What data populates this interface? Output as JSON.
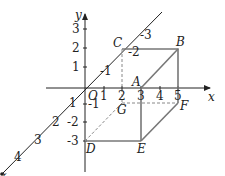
{
  "diagram": {
    "type": "3d-coordinate-box",
    "axes": {
      "x": {
        "label": "x",
        "ticks": [
          "1",
          "2",
          "3",
          "4",
          "5"
        ]
      },
      "y": {
        "label": "y",
        "ticks": [
          "3",
          "2",
          "1",
          "-1",
          "-2",
          "-3"
        ]
      },
      "z": {
        "label": "z",
        "ticks_neg": [
          "-1",
          "-2",
          "-3"
        ],
        "ticks_pos": [
          "1",
          "2",
          "3",
          "4"
        ]
      }
    },
    "origin_label": "O",
    "points": {
      "A": "A",
      "B": "B",
      "C": "C",
      "D": "D",
      "E": "E",
      "F": "F",
      "G": "G"
    },
    "colors": {
      "axis": "#222222",
      "box": "#777777",
      "dashed": "#888888"
    }
  }
}
